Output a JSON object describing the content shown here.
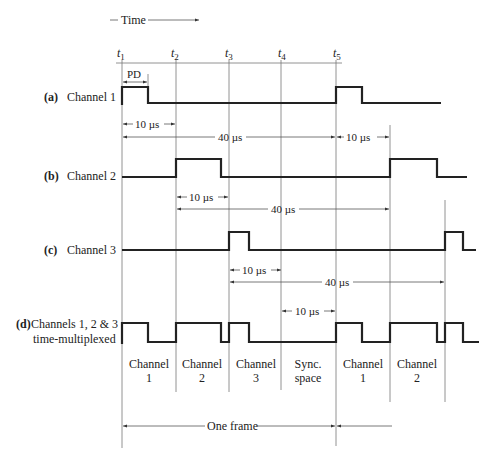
{
  "header": {
    "time_label": "Time"
  },
  "time_marks": [
    {
      "label": "t",
      "sub": "1"
    },
    {
      "label": "t",
      "sub": "2"
    },
    {
      "label": "t",
      "sub": "3"
    },
    {
      "label": "t",
      "sub": "4"
    },
    {
      "label": "t",
      "sub": "5"
    }
  ],
  "channels": [
    {
      "tag": "(a)",
      "name": "Channel 1"
    },
    {
      "tag": "(b)",
      "name": "Channel 2"
    },
    {
      "tag": "(c)",
      "name": "Channel 3"
    },
    {
      "tag": "(d)",
      "name": "Channels 1, 2 & 3",
      "name2": "time-multiplexed"
    }
  ],
  "annotations": {
    "pd": "PD",
    "ch1_offset": "10 µs",
    "ch1_period": "40 µs",
    "ch1_after": "10 µs",
    "ch2_offset": "10 µs",
    "ch2_period": "40 µs",
    "ch3_offset": "10 µs",
    "ch3_period": "40 µs",
    "sync_width": "10 µs",
    "frame": "One frame"
  },
  "slots": [
    {
      "line1": "Channel",
      "line2": "1"
    },
    {
      "line1": "Channel",
      "line2": "2"
    },
    {
      "line1": "Channel",
      "line2": "3"
    },
    {
      "line1": "Sync.",
      "line2": "space"
    },
    {
      "line1": "Channel",
      "line2": "1"
    },
    {
      "line1": "Channel",
      "line2": "2"
    }
  ],
  "timing": {
    "channel_spacing_us": 10,
    "frame_period_us": 40,
    "channels_per_frame": 3,
    "sync_slots_per_frame": 1
  }
}
